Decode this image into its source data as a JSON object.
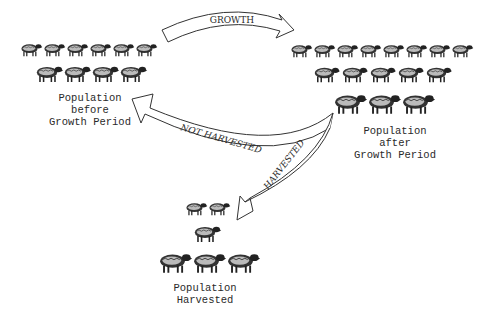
{
  "diagram": {
    "arrows": {
      "growth": "GROWTH",
      "not_harvested": "NOT HARVESTED",
      "harvested": "HARVESTED"
    },
    "nodes": {
      "before": {
        "line1": "Population",
        "line2": "before",
        "line3": "Growth Period",
        "sheep_rows": [
          6,
          4
        ]
      },
      "after": {
        "line1": "Population",
        "line2": "after",
        "line3": "Growth Period",
        "sheep_rows": [
          8,
          5,
          3
        ]
      },
      "harvested": {
        "line1": "Population",
        "line2": "Harvested",
        "sheep_rows": [
          2,
          1,
          3
        ]
      }
    },
    "colors": {
      "ink": "#2a2a2a",
      "background": "#ffffff"
    }
  }
}
